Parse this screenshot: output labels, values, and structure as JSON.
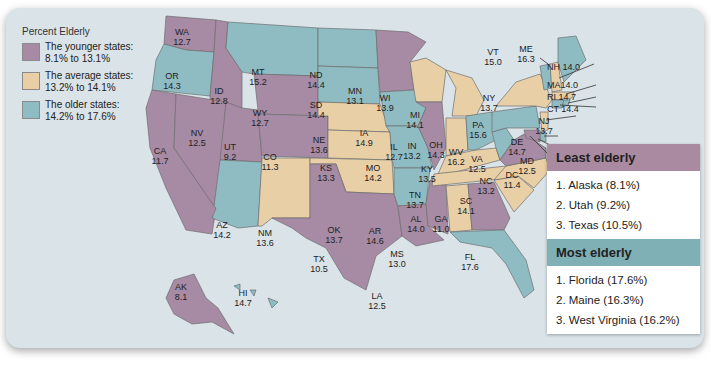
{
  "legend": {
    "title": "Percent Elderly",
    "items": [
      {
        "label": "The younger states:",
        "range": "8.1% to 13.1%",
        "color": "#a78aa3"
      },
      {
        "label": "The average states:",
        "range": "13.2% to 14.1%",
        "color": "#e8cfa6"
      },
      {
        "label": "The older states:",
        "range": "14.2% to 17.6%",
        "color": "#8fbcc3"
      }
    ]
  },
  "states": {
    "WA": {
      "abbr": "WA",
      "value": "12.7"
    },
    "OR": {
      "abbr": "OR",
      "value": "14.3"
    },
    "CA": {
      "abbr": "CA",
      "value": "11.7"
    },
    "ID": {
      "abbr": "ID",
      "value": "12.8"
    },
    "NV": {
      "abbr": "NV",
      "value": "12.5"
    },
    "UT": {
      "abbr": "UT",
      "value": "9.2"
    },
    "AZ": {
      "abbr": "AZ",
      "value": "14.2"
    },
    "MT": {
      "abbr": "MT",
      "value": "15.2"
    },
    "WY": {
      "abbr": "WY",
      "value": "12.7"
    },
    "CO": {
      "abbr": "CO",
      "value": "11.3"
    },
    "NM": {
      "abbr": "NM",
      "value": "13.6"
    },
    "ND": {
      "abbr": "ND",
      "value": "14.4"
    },
    "SD": {
      "abbr": "SD",
      "value": "14.4"
    },
    "NE": {
      "abbr": "NE",
      "value": "13.6"
    },
    "KS": {
      "abbr": "KS",
      "value": "13.3"
    },
    "OK": {
      "abbr": "OK",
      "value": "13.7"
    },
    "TX": {
      "abbr": "TX",
      "value": "10.5"
    },
    "MN": {
      "abbr": "MN",
      "value": "13.1"
    },
    "IA": {
      "abbr": "IA",
      "value": "14.9"
    },
    "MO": {
      "abbr": "MO",
      "value": "14.2"
    },
    "AR": {
      "abbr": "AR",
      "value": "14.6"
    },
    "LA": {
      "abbr": "LA",
      "value": "12.5"
    },
    "WI": {
      "abbr": "WI",
      "value": "13.9"
    },
    "IL": {
      "abbr": "IL",
      "value": "12.7"
    },
    "MS": {
      "abbr": "MS",
      "value": "13.0"
    },
    "MI": {
      "abbr": "MI",
      "value": "14.1"
    },
    "IN": {
      "abbr": "IN",
      "value": "13.2"
    },
    "KY": {
      "abbr": "KY",
      "value": "13.5"
    },
    "TN": {
      "abbr": "TN",
      "value": "13.7"
    },
    "AL": {
      "abbr": "AL",
      "value": "14.0"
    },
    "OH": {
      "abbr": "OH",
      "value": "14.3"
    },
    "WV": {
      "abbr": "WV",
      "value": "16.2"
    },
    "GA": {
      "abbr": "GA",
      "value": "11.0"
    },
    "FL": {
      "abbr": "FL",
      "value": "17.6"
    },
    "SC": {
      "abbr": "SC",
      "value": "14.1"
    },
    "NC": {
      "abbr": "NC",
      "value": "13.2"
    },
    "VA": {
      "abbr": "VA",
      "value": "12.5"
    },
    "PA": {
      "abbr": "PA",
      "value": "15.6"
    },
    "NY": {
      "abbr": "NY",
      "value": "13.7"
    },
    "VT": {
      "abbr": "VT",
      "value": "15.0"
    },
    "ME": {
      "abbr": "ME",
      "value": "16.3"
    },
    "NH": {
      "abbr": "NH",
      "value": "14.0",
      "text": "NH 14.0"
    },
    "MA": {
      "abbr": "MA",
      "value": "14.0",
      "text": "MA14.0"
    },
    "RI": {
      "abbr": "RI",
      "value": "14.7",
      "text": "RI 14.7"
    },
    "CT": {
      "abbr": "CT",
      "value": "14.4",
      "text": "CT 14.4"
    },
    "NJ": {
      "abbr": "NJ",
      "value": "13.7"
    },
    "DE": {
      "abbr": "DE",
      "value": "14.7"
    },
    "MD": {
      "abbr": "MD",
      "value": "12.5"
    },
    "DC": {
      "abbr": "DC",
      "value": "11.4"
    },
    "AK": {
      "abbr": "AK",
      "value": "8.1"
    },
    "HI": {
      "abbr": "HI",
      "value": "14.7"
    }
  },
  "rankings": {
    "least": {
      "title": "Least elderly",
      "items": [
        "1. Alaska (8.1%)",
        "2. Utah (9.2%)",
        "3. Texas (10.5%)"
      ]
    },
    "most": {
      "title": "Most elderly",
      "items": [
        "1. Florida (17.6%)",
        "2. Maine (16.3%)",
        "3. West Virginia (16.2%)"
      ]
    }
  }
}
